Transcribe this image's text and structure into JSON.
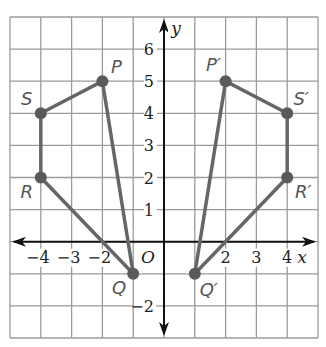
{
  "diagram": {
    "type": "coordinate-plane-reflection",
    "grid": {
      "x_min": -5,
      "x_max": 5,
      "y_min": -3,
      "y_max": 7,
      "step": 1
    },
    "axes": {
      "x_label": "x",
      "y_label": "y",
      "origin_label": "O",
      "x_ticks": [
        {
          "value": -4,
          "label": "−4"
        },
        {
          "value": -3,
          "label": "−3"
        },
        {
          "value": -2,
          "label": "−2"
        },
        {
          "value": 2,
          "label": "2"
        },
        {
          "value": 3,
          "label": "3"
        },
        {
          "value": 4,
          "label": "4"
        }
      ],
      "y_ticks": [
        {
          "value": 1,
          "label": "1"
        },
        {
          "value": 2,
          "label": "2"
        },
        {
          "value": 3,
          "label": "3"
        },
        {
          "value": 4,
          "label": "4"
        },
        {
          "value": 5,
          "label": "5"
        },
        {
          "value": 6,
          "label": "6"
        },
        {
          "value": -2,
          "label": "−2"
        }
      ]
    },
    "figures": [
      {
        "name": "PQRS",
        "points": [
          {
            "label": "P",
            "x": -2,
            "y": 5
          },
          {
            "label": "Q",
            "x": -1,
            "y": -1
          },
          {
            "label": "R",
            "x": -4,
            "y": 2
          },
          {
            "label": "S",
            "x": -4,
            "y": 4
          }
        ]
      },
      {
        "name": "P'Q'R'S'",
        "points": [
          {
            "label": "P′",
            "x": 2,
            "y": 5
          },
          {
            "label": "Q′",
            "x": 1,
            "y": -1
          },
          {
            "label": "R′",
            "x": 4,
            "y": 2
          },
          {
            "label": "S′",
            "x": 4,
            "y": 4
          }
        ]
      }
    ],
    "colors": {
      "grid": "#9a9a9a",
      "axes": "#111111",
      "segments": "#666666",
      "points": "#5a5a5a",
      "point_labels": "#555555"
    }
  }
}
